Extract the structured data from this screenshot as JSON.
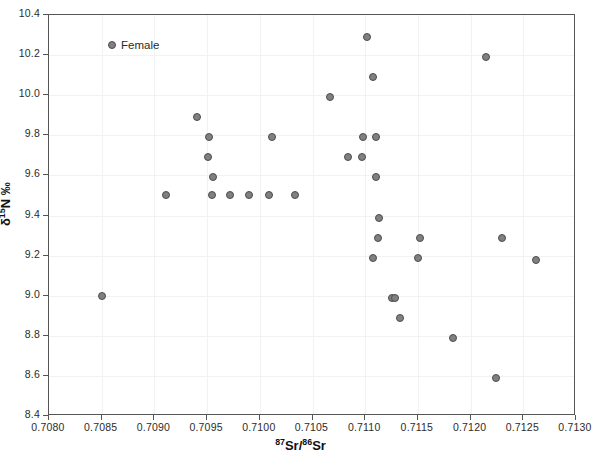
{
  "chart_data": {
    "type": "scatter",
    "title": "",
    "xlabel": "87Sr/86Sr",
    "ylabel": "d15N ‰",
    "xlabel_html": "<sup>87</sup>Sr/<sup>86</sup>Sr",
    "ylabel_html": "δ<sup>15</sup>N ‰",
    "xlim": [
      0.708,
      0.713
    ],
    "ylim": [
      8.4,
      10.4
    ],
    "xticks": [
      "0.7080",
      "0.7085",
      "0.7090",
      "0.7095",
      "0.7100",
      "0.7105",
      "0.7110",
      "0.7115",
      "0.7120",
      "0.7125",
      "0.7130"
    ],
    "xtick_values": [
      0.708,
      0.7085,
      0.709,
      0.7095,
      0.71,
      0.7105,
      0.711,
      0.7115,
      0.712,
      0.7125,
      0.713
    ],
    "yticks": [
      "10.4",
      "10.2",
      "10.0",
      "9.8",
      "9.6",
      "9.4",
      "9.2",
      "9.0",
      "8.8",
      "8.6",
      "8.4"
    ],
    "ytick_values": [
      10.4,
      10.2,
      10.0,
      9.8,
      9.6,
      9.4,
      9.2,
      9.0,
      8.8,
      8.6,
      8.4
    ],
    "grid": true,
    "legend_position": "top-left",
    "marker_color": "#808080",
    "marker_edge_color": "#4d4d4d",
    "frame_color": "#555555",
    "grid_color": "#f2f2f2",
    "series": [
      {
        "name": "Female",
        "marker": "circle",
        "color": "#808080",
        "points": [
          [
            0.7085,
            9.0
          ],
          [
            0.70911,
            9.5
          ],
          [
            0.7094,
            9.89
          ],
          [
            0.70952,
            9.79
          ],
          [
            0.70951,
            9.69
          ],
          [
            0.70956,
            9.59
          ],
          [
            0.70955,
            9.5
          ],
          [
            0.70972,
            9.5
          ],
          [
            0.7099,
            9.5
          ],
          [
            0.71009,
            9.5
          ],
          [
            0.71012,
            9.79
          ],
          [
            0.71033,
            9.5
          ],
          [
            0.71067,
            9.99
          ],
          [
            0.71084,
            9.69
          ],
          [
            0.71098,
            9.79
          ],
          [
            0.71097,
            9.69
          ],
          [
            0.71102,
            10.29
          ],
          [
            0.71107,
            10.09
          ],
          [
            0.7111,
            9.79
          ],
          [
            0.7111,
            9.59
          ],
          [
            0.71113,
            9.39
          ],
          [
            0.71107,
            9.19
          ],
          [
            0.71112,
            9.29
          ],
          [
            0.71125,
            8.99
          ],
          [
            0.71128,
            8.99
          ],
          [
            0.71133,
            8.89
          ],
          [
            0.71152,
            9.29
          ],
          [
            0.7115,
            9.19
          ],
          [
            0.71183,
            8.79
          ],
          [
            0.71215,
            10.19
          ],
          [
            0.71224,
            8.59
          ],
          [
            0.7123,
            9.29
          ],
          [
            0.71262,
            9.18
          ]
        ]
      }
    ]
  },
  "legend": {
    "entries": [
      {
        "label": "Female"
      }
    ]
  }
}
